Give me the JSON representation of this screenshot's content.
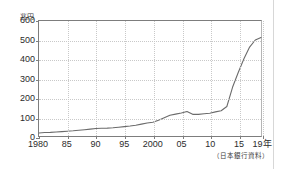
{
  "figure": {
    "unit_label": "兆円",
    "source_note": "（日本銀行資料）"
  },
  "chart_data": {
    "type": "line",
    "title": "",
    "subtitle": "",
    "xlabel": "",
    "ylabel": "兆円",
    "unit": "兆円",
    "source": "（日本銀行資料）",
    "grid": true,
    "legend": false,
    "legend_position": "none",
    "xlim": [
      1980,
      2019
    ],
    "ylim": [
      0,
      600
    ],
    "yticks": [
      0,
      100,
      200,
      300,
      400,
      500,
      600
    ],
    "ytick_labels": [
      "0",
      "100",
      "200",
      "300",
      "400",
      "500",
      "600"
    ],
    "xticks": [
      1980,
      1985,
      1990,
      1995,
      2000,
      2005,
      2010,
      2015,
      2019
    ],
    "xtick_labels": [
      "1980",
      "85",
      "90",
      "95",
      "2000",
      "05",
      "10",
      "15",
      "19年"
    ],
    "line_color": "#6b6b6b",
    "series": [
      {
        "name": "マネタリーベース",
        "x": [
          1980,
          1981,
          1982,
          1983,
          1984,
          1985,
          1986,
          1987,
          1988,
          1989,
          1990,
          1991,
          1992,
          1993,
          1994,
          1995,
          1996,
          1997,
          1998,
          1999,
          2000,
          2001,
          2002,
          2003,
          2004,
          2005,
          2006,
          2007,
          2008,
          2009,
          2010,
          2011,
          2012,
          2013,
          2014,
          2015,
          2016,
          2017,
          2018,
          2019
        ],
        "values": [
          16,
          18,
          19,
          21,
          23,
          25,
          27,
          30,
          33,
          36,
          39,
          40,
          41,
          43,
          46,
          49,
          52,
          56,
          62,
          68,
          72,
          82,
          95,
          108,
          114,
          120,
          128,
          113,
          113,
          116,
          119,
          126,
          132,
          154,
          254,
          331,
          403,
          464,
          501,
          514
        ]
      }
    ]
  }
}
